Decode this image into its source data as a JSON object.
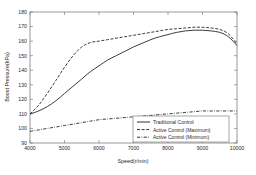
{
  "chart_data": {
    "type": "line",
    "title": "",
    "xlabel": "Speed(r/min)",
    "ylabel": "Boost Pressure(kPa)",
    "xlim": [
      4000,
      10000
    ],
    "ylim": [
      90,
      180
    ],
    "xticks": [
      4000,
      5000,
      6000,
      7000,
      8000,
      9000,
      10000
    ],
    "yticks": [
      90,
      100,
      110,
      120,
      130,
      140,
      150,
      160,
      170,
      180
    ],
    "xtick_labels": [
      "4000",
      "5000",
      "6000",
      "7000",
      "8000",
      "9000",
      "10000"
    ],
    "ytick_labels": [
      "90",
      "100",
      "110",
      "120",
      "130",
      "140",
      "150",
      "160",
      "170",
      "180"
    ],
    "grid": false,
    "legend_position": "bottom-right",
    "x": [
      4000,
      4250,
      4500,
      4750,
      5000,
      5250,
      5500,
      5750,
      6000,
      6250,
      6500,
      6750,
      7000,
      7250,
      7500,
      7750,
      8000,
      8250,
      8500,
      8750,
      9000,
      9250,
      9500,
      9750,
      10000
    ],
    "series": [
      {
        "name": "Traditional Control",
        "style": "solid",
        "color": "#1a1a1a",
        "values": [
          110,
          112,
          115,
          119,
          124,
          129,
          134,
          139,
          143,
          147,
          150,
          153,
          156,
          158.5,
          161,
          163,
          164.5,
          166,
          167,
          167.5,
          167.5,
          167,
          166,
          163,
          157
        ]
      },
      {
        "name": "Active Control (Maximum)",
        "style": "dashed",
        "color": "#1a1a1a",
        "values": [
          110,
          116,
          124,
          133,
          142,
          150,
          156,
          159,
          160,
          161,
          162,
          163,
          164,
          165,
          166,
          167,
          168,
          168.5,
          169,
          169.5,
          169.5,
          169,
          168,
          165,
          158
        ]
      },
      {
        "name": "Active Control (Minimum)",
        "style": "dashdot",
        "color": "#1a1a1a",
        "values": [
          98,
          99,
          100,
          101,
          102,
          103,
          104,
          105,
          106,
          106.5,
          107,
          107.5,
          108,
          108.5,
          109,
          109.5,
          110,
          110.5,
          111,
          111.5,
          112,
          112,
          112,
          112,
          112
        ]
      }
    ],
    "legend_entries": [
      {
        "label": "Traditional Control",
        "style": "solid"
      },
      {
        "label": "Active Control (Maximum)",
        "style": "dashed"
      },
      {
        "label": "Active Control (Minimum)",
        "style": "dashdot"
      }
    ]
  }
}
